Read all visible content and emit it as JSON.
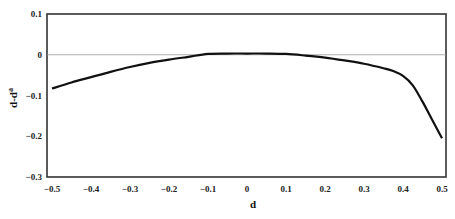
{
  "chart_data": {
    "type": "line",
    "title": "",
    "xlabel": "d",
    "ylabel": "d-d",
    "ylabel_superscript": "a",
    "xlim": [
      -0.5,
      0.5
    ],
    "ylim": [
      -0.3,
      0.1
    ],
    "x_ticks": [
      "-0.5",
      "-0.4",
      "-0.3",
      "-0.2",
      "-0.1",
      "0",
      "0.1",
      "0.2",
      "0.3",
      "0.4",
      "0.5"
    ],
    "y_ticks": [
      "0.1",
      "0",
      "-0.1",
      "-0.2",
      "-0.3"
    ],
    "grid": false,
    "reference_line": {
      "y": 0,
      "color": "#9a9a9a"
    },
    "legend": null,
    "series": [
      {
        "name": "d-d^a",
        "color": "#111111",
        "x": [
          -0.5,
          -0.45,
          -0.4,
          -0.35,
          -0.3,
          -0.25,
          -0.2,
          -0.15,
          -0.1,
          -0.05,
          0.0,
          0.05,
          0.1,
          0.15,
          0.2,
          0.25,
          0.3,
          0.35,
          0.375,
          0.4,
          0.425,
          0.45,
          0.475,
          0.5
        ],
        "values": [
          -0.083,
          -0.068,
          -0.055,
          -0.042,
          -0.03,
          -0.02,
          -0.012,
          -0.005,
          0.002,
          0.003,
          0.003,
          0.003,
          0.002,
          -0.002,
          -0.007,
          -0.014,
          -0.022,
          -0.033,
          -0.04,
          -0.052,
          -0.075,
          -0.115,
          -0.16,
          -0.205
        ]
      }
    ]
  }
}
